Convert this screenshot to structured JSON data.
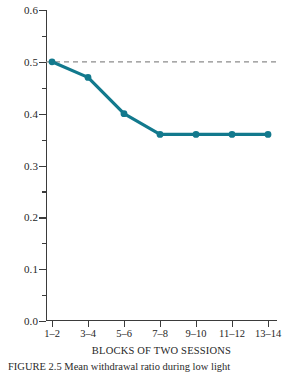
{
  "chart_data": {
    "type": "line",
    "title": "",
    "xlabel": "BLOCKS OF TWO SESSIONS",
    "ylabel": "MEAN APPROACH-WITHDRAWAL RATIO",
    "categories": [
      "1–2",
      "3–4",
      "5–6",
      "7–8",
      "9–10",
      "11–12",
      "13–14"
    ],
    "values": [
      0.5,
      0.47,
      0.4,
      0.36,
      0.36,
      0.36,
      0.36
    ],
    "series": [
      {
        "name": "Mean approach-withdrawal ratio",
        "values": [
          0.5,
          0.47,
          0.4,
          0.36,
          0.36,
          0.36,
          0.36
        ],
        "color": "#12798D",
        "marker": "circle"
      }
    ],
    "ylim": [
      0.0,
      0.6
    ],
    "ytick_labels": [
      "0.0",
      "0.1",
      "0.2",
      "0.3",
      "0.4",
      "0.5",
      "0.6"
    ],
    "ytick_values": [
      0.0,
      0.1,
      0.2,
      0.3,
      0.4,
      0.5,
      0.6
    ],
    "ytick_minor_values": [
      0.05,
      0.15,
      0.25,
      0.35,
      0.45,
      0.55
    ],
    "grid": false,
    "legend": "none",
    "annotations": [
      {
        "type": "reference-line",
        "orientation": "horizontal",
        "value": 0.5,
        "style": "dashed",
        "color": "#8c8c8c"
      }
    ]
  },
  "figure": {
    "caption": "FIGURE 2.5  Mean withdrawal ratio during low light"
  },
  "colors": {
    "line": "#12798D",
    "marker": "#12798D",
    "axis": "#3b3b3b",
    "reference": "#8c8c8c",
    "background": "#ffffff"
  }
}
